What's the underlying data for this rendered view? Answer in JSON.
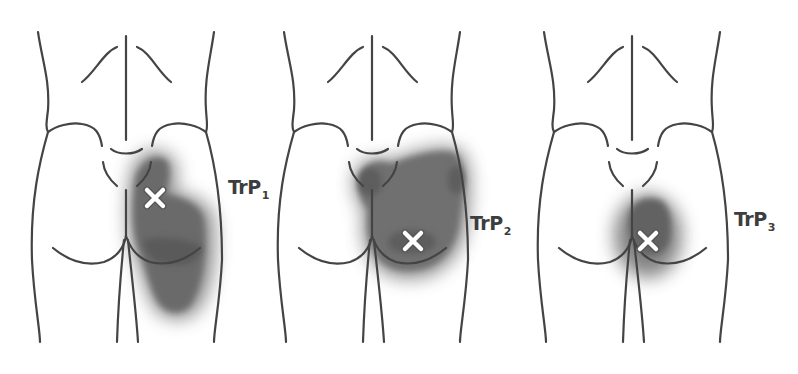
{
  "figure": {
    "colors": {
      "outline": "#444444",
      "pain_zone": "#6e6e6e",
      "pain_core": "#575757",
      "marker": "#ffffff",
      "label": "#3d3d3d",
      "background": "#ffffff"
    },
    "panels": [
      {
        "id": "trp1",
        "label_main": "TrP",
        "label_sub": "1",
        "marker_symbol": "×",
        "marker_position": {
          "x": 155,
          "y": 198
        },
        "label_position": {
          "x": 228,
          "y": 176
        }
      },
      {
        "id": "trp2",
        "label_main": "TrP",
        "label_sub": "2",
        "marker_symbol": "×",
        "marker_position": {
          "x": 413,
          "y": 241
        },
        "label_position": {
          "x": 470,
          "y": 212
        }
      },
      {
        "id": "trp3",
        "label_main": "TrP",
        "label_sub": "3",
        "marker_symbol": "×",
        "marker_position": {
          "x": 648,
          "y": 241
        },
        "label_position": {
          "x": 734,
          "y": 208
        }
      }
    ]
  }
}
